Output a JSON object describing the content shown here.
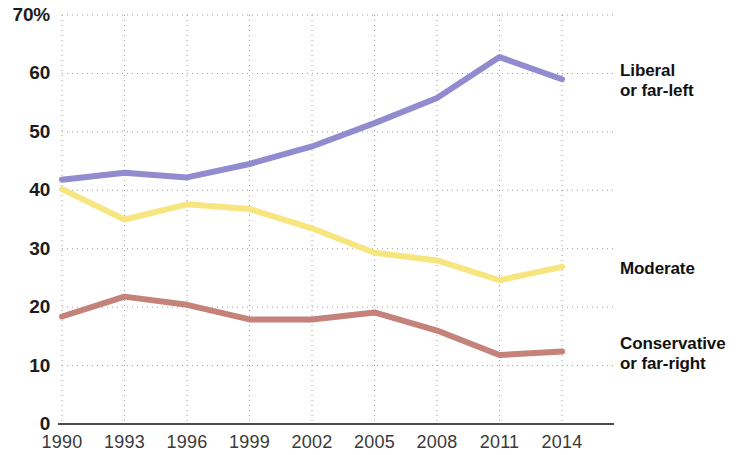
{
  "chart_data": {
    "type": "line",
    "title": "",
    "subtitle": "",
    "xlabel": "",
    "ylabel": "",
    "x": [
      1990,
      1993,
      1996,
      1999,
      2002,
      2005,
      2008,
      2011,
      2014
    ],
    "xtick_labels": [
      "1990",
      "1993",
      "1996",
      "1999",
      "2002",
      "2005",
      "2008",
      "2011",
      "2014"
    ],
    "ytick_labels": [
      "0",
      "10",
      "20",
      "30",
      "40",
      "50",
      "60",
      "70%"
    ],
    "ytick_values": [
      0,
      10,
      20,
      30,
      40,
      50,
      60,
      70
    ],
    "ylim": [
      0,
      70
    ],
    "xlim": [
      1990,
      2014
    ],
    "grid": true,
    "grid_style": "dotted",
    "legend_position": "right-inline-labels",
    "series": [
      {
        "name": "Liberal or far-left",
        "label": "Liberal\nor far-left",
        "color": "#938bd0",
        "values": [
          41.8,
          43.0,
          42.2,
          44.5,
          47.5,
          51.5,
          55.8,
          62.8,
          59.0
        ]
      },
      {
        "name": "Moderate",
        "label": "Moderate",
        "color": "#f7e57f",
        "values": [
          40.2,
          35.0,
          37.6,
          36.8,
          33.5,
          29.3,
          28.0,
          24.6,
          26.9
        ]
      },
      {
        "name": "Conservative or far-right",
        "label": "Conservative\nor far-right",
        "color": "#c4827a",
        "values": [
          18.4,
          21.8,
          20.4,
          17.9,
          17.9,
          19.1,
          16.0,
          11.8,
          12.4
        ]
      }
    ]
  },
  "axis": {
    "percent_suffix": "%",
    "baseline_color": "#4a4a4a",
    "grid_color": "#9a9a9a"
  }
}
